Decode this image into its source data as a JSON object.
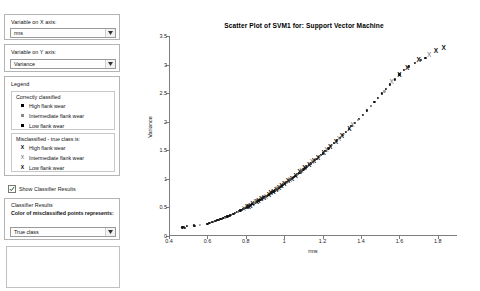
{
  "controls": {
    "x_axis_group_label": "Variable on X axis:",
    "x_axis_value": "rms",
    "y_axis_group_label": "Variable on Y axis:",
    "y_axis_value": "Variance",
    "legend_title": "Legend",
    "legend_correct_heading": "Correctly classified",
    "legend_correct_items": [
      {
        "marker": "square",
        "label": "High flank wear"
      },
      {
        "marker": "square-gray",
        "label": "Intermediate flank wear"
      },
      {
        "marker": "square",
        "label": "Low flank wear"
      }
    ],
    "legend_wrong_heading": "Misclassified - true class is:",
    "legend_wrong_items": [
      {
        "marker": "X",
        "label": "High flank wear"
      },
      {
        "marker": "X-thin",
        "label": "Intermediate flank wear"
      },
      {
        "marker": "X",
        "label": "Low flank wear"
      }
    ],
    "show_classifier_results_label": "Show Classifier Results",
    "show_classifier_results_checked": true,
    "classifier_results_title": "Classifier Results",
    "classifier_results_description": "Color of misclassified points represents:",
    "classifier_results_value": "True class",
    "dropdown_arrow_icon": "chevron-down-icon"
  },
  "chart_data": {
    "type": "scatter",
    "title": "Scatter Plot of SVM1 for: Support Vector Machine",
    "xlabel": "rms",
    "ylabel": "Variance",
    "xlim": [
      0.4,
      1.9
    ],
    "ylim": [
      0,
      3.5
    ],
    "xticks": [
      0.4,
      0.6,
      0.8,
      1.0,
      1.2,
      1.4,
      1.6,
      1.8
    ],
    "xtick_labels": [
      "0.4",
      "0.6",
      "0.8",
      "1",
      "1.2",
      "1.4",
      "1.6",
      "1.8"
    ],
    "yticks": [
      0,
      0.5,
      1.0,
      1.5,
      2.0,
      2.5,
      3.0,
      3.5
    ],
    "ytick_labels": [
      "0",
      "0.5",
      "1",
      "1.5",
      "2",
      "2.5",
      "3",
      "3.5"
    ],
    "grid": false,
    "legend_position": "external-left",
    "series": [
      {
        "name": "Correctly classified",
        "marker": "dot",
        "points": [
          [
            0.47,
            0.15
          ],
          [
            0.478,
            0.16
          ],
          [
            0.483,
            0.145
          ],
          [
            0.492,
            0.17
          ],
          [
            0.53,
            0.185
          ],
          [
            0.536,
            0.178
          ],
          [
            0.6,
            0.215
          ],
          [
            0.608,
            0.228
          ],
          [
            0.615,
            0.235
          ],
          [
            0.622,
            0.24
          ],
          [
            0.63,
            0.25
          ],
          [
            0.637,
            0.258
          ],
          [
            0.645,
            0.268
          ],
          [
            0.652,
            0.275
          ],
          [
            0.66,
            0.285
          ],
          [
            0.668,
            0.295
          ],
          [
            0.675,
            0.305
          ],
          [
            0.683,
            0.315
          ],
          [
            0.69,
            0.325
          ],
          [
            0.697,
            0.332
          ],
          [
            0.704,
            0.342
          ],
          [
            0.71,
            0.352
          ],
          [
            0.717,
            0.362
          ],
          [
            0.724,
            0.372
          ],
          [
            0.731,
            0.382
          ],
          [
            0.738,
            0.392
          ],
          [
            0.745,
            0.405
          ],
          [
            0.752,
            0.415
          ],
          [
            0.758,
            0.425
          ],
          [
            0.765,
            0.436
          ],
          [
            0.772,
            0.448
          ],
          [
            0.779,
            0.458
          ],
          [
            0.786,
            0.47
          ],
          [
            0.792,
            0.482
          ],
          [
            0.799,
            0.492
          ],
          [
            0.806,
            0.505
          ],
          [
            0.813,
            0.518
          ],
          [
            0.82,
            0.53
          ],
          [
            0.827,
            0.542
          ],
          [
            0.834,
            0.556
          ],
          [
            0.841,
            0.568
          ],
          [
            0.848,
            0.58
          ],
          [
            0.855,
            0.594
          ],
          [
            0.862,
            0.608
          ],
          [
            0.869,
            0.622
          ],
          [
            0.876,
            0.635
          ],
          [
            0.883,
            0.65
          ],
          [
            0.89,
            0.664
          ],
          [
            0.897,
            0.678
          ],
          [
            0.904,
            0.692
          ],
          [
            0.911,
            0.706
          ],
          [
            0.918,
            0.722
          ],
          [
            0.925,
            0.736
          ],
          [
            0.932,
            0.752
          ],
          [
            0.939,
            0.766
          ],
          [
            0.946,
            0.782
          ],
          [
            0.953,
            0.798
          ],
          [
            0.96,
            0.812
          ],
          [
            0.967,
            0.828
          ],
          [
            0.974,
            0.845
          ],
          [
            0.981,
            0.86
          ],
          [
            0.988,
            0.878
          ],
          [
            0.995,
            0.894
          ],
          [
            1.002,
            0.91
          ],
          [
            1.009,
            0.928
          ],
          [
            1.016,
            0.945
          ],
          [
            1.023,
            0.962
          ],
          [
            1.03,
            0.98
          ],
          [
            1.037,
            0.998
          ],
          [
            1.044,
            1.015
          ],
          [
            1.051,
            1.034
          ],
          [
            1.058,
            1.052
          ],
          [
            1.065,
            1.07
          ],
          [
            1.072,
            1.09
          ],
          [
            1.079,
            1.108
          ],
          [
            1.086,
            1.128
          ],
          [
            1.093,
            1.146
          ],
          [
            1.1,
            1.166
          ],
          [
            1.11,
            1.192
          ],
          [
            1.12,
            1.218
          ],
          [
            1.13,
            1.246
          ],
          [
            1.14,
            1.272
          ],
          [
            1.15,
            1.3
          ],
          [
            1.16,
            1.328
          ],
          [
            1.17,
            1.356
          ],
          [
            1.18,
            1.384
          ],
          [
            1.19,
            1.414
          ],
          [
            1.2,
            1.444
          ],
          [
            1.215,
            1.486
          ],
          [
            1.23,
            1.532
          ],
          [
            1.245,
            1.578
          ],
          [
            1.26,
            1.624
          ],
          [
            1.275,
            1.672
          ],
          [
            1.29,
            1.72
          ],
          [
            1.305,
            1.768
          ],
          [
            1.32,
            1.818
          ],
          [
            1.335,
            1.868
          ],
          [
            1.35,
            1.92
          ],
          [
            1.37,
            1.986
          ],
          [
            1.39,
            2.056
          ],
          [
            1.41,
            2.126
          ],
          [
            1.43,
            2.198
          ],
          [
            1.45,
            2.27
          ],
          [
            1.47,
            2.344
          ],
          [
            1.49,
            2.42
          ],
          [
            1.51,
            2.496
          ],
          [
            1.53,
            2.574
          ],
          [
            1.55,
            2.652
          ],
          [
            1.575,
            2.74
          ],
          [
            1.6,
            2.828
          ],
          [
            1.625,
            2.902
          ],
          [
            1.65,
            2.968
          ],
          [
            1.68,
            3.03
          ],
          [
            1.71,
            3.086
          ],
          [
            1.735,
            3.12
          ]
        ]
      },
      {
        "name": "Correctly classified - intermediate",
        "marker": "dot-gray",
        "points": [
          [
            0.56,
            0.195
          ],
          [
            0.69,
            0.318
          ],
          [
            0.76,
            0.42
          ],
          [
            0.845,
            0.575
          ],
          [
            0.9,
            0.67
          ],
          [
            0.955,
            0.805
          ],
          [
            1.012,
            0.932
          ],
          [
            1.068,
            1.078
          ],
          [
            1.125,
            1.232
          ],
          [
            1.185,
            1.396
          ],
          [
            1.25,
            1.588
          ],
          [
            1.312,
            1.79
          ],
          [
            1.382,
            2.028
          ],
          [
            1.452,
            2.278
          ],
          [
            1.522,
            2.53
          ]
        ]
      },
      {
        "name": "Misclassified",
        "marker": "X",
        "points": [
          [
            0.806,
            0.5
          ],
          [
            0.815,
            0.515
          ],
          [
            0.824,
            0.53
          ],
          [
            0.834,
            0.552
          ],
          [
            0.858,
            0.6
          ],
          [
            0.866,
            0.614
          ],
          [
            0.88,
            0.644
          ],
          [
            0.894,
            0.672
          ],
          [
            0.92,
            0.726
          ],
          [
            0.93,
            0.748
          ],
          [
            0.944,
            0.778
          ],
          [
            0.958,
            0.808
          ],
          [
            0.972,
            0.84
          ],
          [
            0.986,
            0.872
          ],
          [
            1.0,
            0.906
          ],
          [
            1.02,
            0.956
          ],
          [
            1.04,
            1.004
          ],
          [
            1.06,
            1.058
          ],
          [
            1.08,
            1.114
          ],
          [
            1.105,
            1.182
          ],
          [
            1.13,
            1.25
          ],
          [
            1.155,
            1.316
          ],
          [
            1.175,
            1.372
          ],
          [
            1.205,
            1.456
          ],
          [
            1.24,
            1.556
          ],
          [
            1.27,
            1.648
          ],
          [
            1.3,
            1.744
          ],
          [
            1.34,
            1.878
          ],
          [
            1.6,
            2.826
          ],
          [
            1.64,
            2.946
          ],
          [
            1.7,
            3.072
          ],
          [
            1.79,
            3.24
          ],
          [
            1.83,
            3.29
          ]
        ]
      },
      {
        "name": "Misclassified - intermediate",
        "marker": "X-thin",
        "points": [
          [
            0.79,
            0.478
          ],
          [
            0.85,
            0.588
          ],
          [
            0.905,
            0.688
          ],
          [
            0.965,
            0.822
          ],
          [
            1.03,
            0.985
          ],
          [
            1.09,
            1.14
          ],
          [
            1.145,
            1.296
          ],
          [
            1.22,
            1.502
          ],
          [
            1.285,
            1.706
          ],
          [
            1.355,
            1.936
          ],
          [
            1.56,
            2.69
          ],
          [
            1.755,
            3.176
          ]
        ]
      }
    ]
  }
}
